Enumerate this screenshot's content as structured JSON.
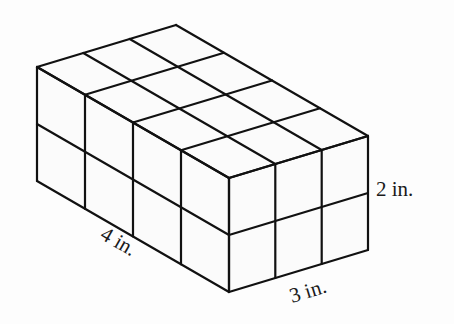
{
  "diagram": {
    "dimensions": {
      "length_units": 4,
      "width_units": 3,
      "height_units": 2
    },
    "labels": {
      "length": "4 in.",
      "width": "3 in.",
      "height": "2 in."
    },
    "colors": {
      "line": "#111111",
      "background": "#fdfdfd",
      "text": "#1a1a1a"
    }
  }
}
